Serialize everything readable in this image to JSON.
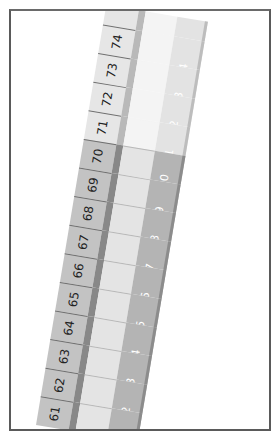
{
  "figure": {
    "left_column_numbers": [
      "74",
      "73",
      "72",
      "71",
      "70",
      "69",
      "68",
      "67",
      "66",
      "65",
      "64",
      "63",
      "62",
      "61"
    ],
    "right_column_numbers": [
      "4",
      "3",
      "2",
      "1",
      "10",
      "9",
      "8",
      "7",
      "6",
      "5",
      "4",
      "3",
      "2",
      "1"
    ],
    "shaded_range": "61-70",
    "faded_range": "71-74",
    "colors": {
      "frame": "#5a5a5a",
      "left_cell_shaded": "#c3c3c3",
      "left_cell_faded": "#e6e6e6",
      "divider_shaded": "#888888",
      "middle_shaded": "#e4e4e4",
      "right_shaded": "#b4b4b4",
      "right_faded": "#e3e3e3"
    }
  }
}
